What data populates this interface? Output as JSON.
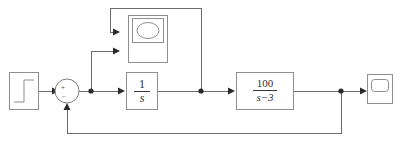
{
  "diagram": {
    "type": "control-system-block-diagram",
    "title": "",
    "blocks": [
      {
        "id": "step",
        "name": "step-input-block",
        "kind": "step-source",
        "label": "",
        "x": 9,
        "y": 72,
        "w": 30,
        "h": 38
      },
      {
        "id": "sum",
        "name": "summing-junction",
        "kind": "sum",
        "signs": [
          "+",
          "-"
        ],
        "plus_label": "+",
        "minus_label": "−",
        "cx": 67,
        "cy": 91,
        "r": 12
      },
      {
        "id": "xygraph",
        "name": "xy-graph-block",
        "kind": "xy-graph",
        "label": "",
        "x": 128,
        "y": 15,
        "w": 40,
        "h": 48
      },
      {
        "id": "integrator",
        "name": "integrator-block",
        "kind": "transfer-function",
        "numerator": "1",
        "denominator": "s",
        "x": 126,
        "y": 72,
        "w": 32,
        "h": 38
      },
      {
        "id": "plant",
        "name": "plant-transfer-function-block",
        "kind": "transfer-function",
        "numerator": "100",
        "denominator": "s−3",
        "x": 236,
        "y": 72,
        "w": 58,
        "h": 38
      },
      {
        "id": "scope",
        "name": "scope-block",
        "kind": "scope",
        "label": "",
        "x": 367,
        "y": 74,
        "w": 26,
        "h": 30
      }
    ],
    "signals": [
      {
        "name": "wire-step-to-sum",
        "from": "step",
        "to": "sum"
      },
      {
        "name": "wire-sum-to-integrator",
        "from": "sum",
        "to": "integrator"
      },
      {
        "name": "wire-branch-to-xygraph-input2",
        "from": "sum-output-junction",
        "to": "xygraph"
      },
      {
        "name": "wire-integrator-to-plant",
        "from": "integrator",
        "to": "plant"
      },
      {
        "name": "wire-branch-to-xygraph-input1",
        "from": "integrator-output-junction",
        "to": "xygraph"
      },
      {
        "name": "wire-plant-to-scope",
        "from": "plant",
        "to": "scope"
      },
      {
        "name": "wire-feedback-to-sum",
        "from": "plant-output-junction",
        "to": "sum"
      }
    ],
    "junctions": [
      {
        "name": "sum-output-junction",
        "x": 91,
        "y": 91
      },
      {
        "name": "integrator-output-junction",
        "x": 201,
        "y": 91
      },
      {
        "name": "plant-output-junction",
        "x": 341,
        "y": 91
      }
    ],
    "colors": {
      "background": "#ffffff",
      "block_stroke": "#8f8f8f",
      "wire_stroke": "#6b6b6b",
      "arrow_fill": "#2a2a2a",
      "text": "#2f2f2f"
    }
  }
}
